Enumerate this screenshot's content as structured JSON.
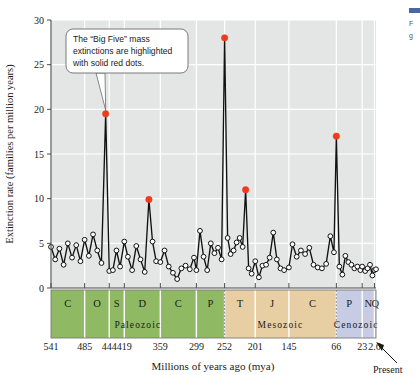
{
  "chart_data": {
    "type": "line",
    "title": "",
    "xlabel": "Millions of years ago (mya)",
    "ylabel": "Extinction rate (families per million years)",
    "xlim": [
      541,
      0
    ],
    "ylim": [
      0,
      30
    ],
    "yticks": [
      0,
      5,
      10,
      15,
      20,
      25,
      30
    ],
    "xticks": [
      541,
      485,
      444,
      419,
      359,
      299,
      252,
      201,
      145,
      66,
      23,
      2.6
    ],
    "xticklabels": [
      "541",
      "485",
      "444",
      "419",
      "359",
      "299",
      "252",
      "201",
      "145",
      "66",
      "23",
      "2.6"
    ],
    "grid": true,
    "legend": "none",
    "series": [
      {
        "name": "Extinction rate",
        "x": [
          541,
          534,
          527,
          520,
          513,
          506,
          499,
          492,
          485,
          478,
          471,
          464,
          457,
          450,
          444,
          438,
          432,
          426,
          419,
          413,
          406,
          399,
          392,
          385,
          378,
          372,
          366,
          359,
          352,
          345,
          338,
          331,
          324,
          317,
          310,
          303,
          299,
          293,
          287,
          281,
          275,
          269,
          263,
          257,
          252,
          247,
          242,
          237,
          232,
          227,
          222,
          217,
          212,
          207,
          201,
          195,
          189,
          183,
          177,
          171,
          165,
          159,
          153,
          145,
          139,
          132,
          125,
          118,
          111,
          104,
          97,
          90,
          83,
          76,
          70,
          66,
          61,
          56,
          51,
          46,
          41,
          36,
          31,
          26,
          23,
          18,
          14,
          10,
          6,
          2.6,
          0
        ],
        "y": [
          4.6,
          3.2,
          4.4,
          2.6,
          5.0,
          3.4,
          4.8,
          3.0,
          5.4,
          3.6,
          6.0,
          4.2,
          2.8,
          19.5,
          1.9,
          2.0,
          4.2,
          2.4,
          5.2,
          3.5,
          2.0,
          4.7,
          3.2,
          1.8,
          9.9,
          5.2,
          3.0,
          2.9,
          4.2,
          2.4,
          1.7,
          1.0,
          2.2,
          2.5,
          2.1,
          3.4,
          2.0,
          6.4,
          3.5,
          2.0,
          5.0,
          3.9,
          4.5,
          3.2,
          28.0,
          5.6,
          3.8,
          4.2,
          5.1,
          5.6,
          4.6,
          11.0,
          2.2,
          1.6,
          3.0,
          1.2,
          2.5,
          2.6,
          3.4,
          6.2,
          3.2,
          2.2,
          2.0,
          2.3,
          4.9,
          3.5,
          4.2,
          3.8,
          4.5,
          2.6,
          2.3,
          2.2,
          2.7,
          5.8,
          4.0,
          17.0,
          2.4,
          1.5,
          3.6,
          2.9,
          2.6,
          2.2,
          2.4,
          2.0,
          2.4,
          1.9,
          2.2,
          2.6,
          1.4,
          2.0,
          2.1
        ]
      }
    ],
    "highlighted_points": [
      {
        "label": "End-Ordovician",
        "x": 450,
        "y": 19.5
      },
      {
        "label": "Late Devonian",
        "x": 378,
        "y": 9.9
      },
      {
        "label": "End-Permian",
        "x": 252,
        "y": 28.0
      },
      {
        "label": "End-Triassic",
        "x": 217,
        "y": 11.0
      },
      {
        "label": "End-Cretaceous",
        "x": 66,
        "y": 17.0
      }
    ],
    "annotations": [
      {
        "name": "big-five-callout",
        "lines": [
          "The “Big Five” mass",
          "extinctions are highlighted",
          "with solid red dots."
        ],
        "points_to": {
          "x": 450,
          "y": 19.5
        }
      },
      {
        "name": "present-label",
        "text": "Present"
      }
    ],
    "timescale": {
      "periods": [
        {
          "letter": "C",
          "start": 541,
          "end": 485
        },
        {
          "letter": "O",
          "start": 485,
          "end": 444
        },
        {
          "letter": "S",
          "start": 444,
          "end": 419
        },
        {
          "letter": "D",
          "start": 419,
          "end": 359
        },
        {
          "letter": "C",
          "start": 359,
          "end": 299
        },
        {
          "letter": "P",
          "start": 299,
          "end": 252
        },
        {
          "letter": "T",
          "start": 252,
          "end": 201
        },
        {
          "letter": "J",
          "start": 201,
          "end": 145
        },
        {
          "letter": "C",
          "start": 145,
          "end": 66
        },
        {
          "letter": "P",
          "start": 66,
          "end": 23
        },
        {
          "letter": "N",
          "start": 23,
          "end": 2.6
        },
        {
          "letter": "Q",
          "start": 2.6,
          "end": 0
        }
      ],
      "eras": [
        {
          "name": "Paleozoic",
          "start": 541,
          "end": 252,
          "color": "#8fba63"
        },
        {
          "name": "Mesozoic",
          "start": 252,
          "end": 66,
          "color": "#e8cfa3"
        },
        {
          "name": "Cenozoic",
          "start": 66,
          "end": 0,
          "color": "#c7cbe4"
        }
      ]
    },
    "colors": {
      "plot_background": "#e4e6e6",
      "gridline": "#ffffff",
      "line": "#111111",
      "marker_fill": "#ffffff",
      "marker_stroke": "#111111",
      "highlight": "#ef3b1c",
      "paleozoic": "#8fba63",
      "mesozoic": "#e8cfa3",
      "cenozoic": "#c7cbe4"
    }
  }
}
